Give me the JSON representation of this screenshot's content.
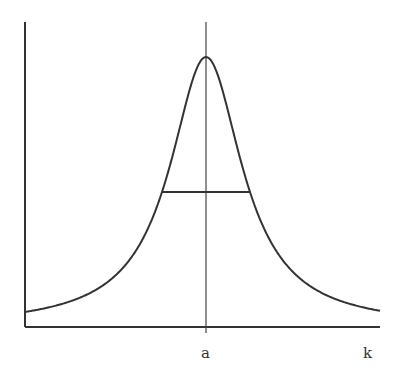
{
  "diagram": {
    "type": "lorentzian-line-shape",
    "x_axis_label": "k",
    "center_label": "a",
    "colors": {
      "stroke": "#333333",
      "background": "#ffffff"
    },
    "geometry": {
      "origin": [
        25,
        327
      ],
      "x_axis_end": 380,
      "y_axis_top": 22,
      "center_x": 206,
      "peak_y": 57,
      "half_width": 44,
      "half_max_y": 192
    }
  }
}
